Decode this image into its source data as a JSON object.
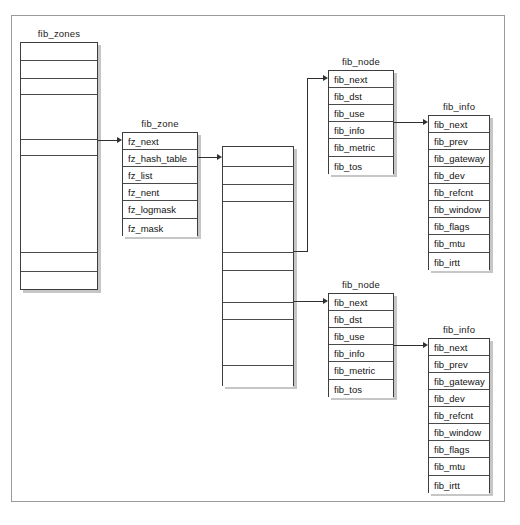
{
  "diagram": {
    "frame": {
      "label": "diagram-frame"
    },
    "structs": [
      {
        "id": "fib-zones",
        "name": "fib_zones",
        "rows": [
          "",
          "",
          "",
          "",
          "",
          "",
          "",
          ""
        ]
      },
      {
        "id": "fib-zone",
        "name": "fib_zone",
        "rows": [
          "fz_next",
          "fz_hash_table",
          "fz_list",
          "fz_nent",
          "fz_logmask",
          "fz_mask"
        ]
      },
      {
        "id": "hash-table",
        "name": "",
        "rows": [
          "",
          "",
          "",
          "",
          "",
          "",
          "",
          "",
          ""
        ]
      },
      {
        "id": "fib-node-top",
        "name": "fib_node",
        "rows": [
          "fib_next",
          "fib_dst",
          "fib_use",
          "fib_info",
          "fib_metric",
          "fib_tos"
        ]
      },
      {
        "id": "fib-info-top",
        "name": "fib_info",
        "rows": [
          "fib_next",
          "fib_prev",
          "fib_gateway",
          "fib_dev",
          "fib_refcnt",
          "fib_window",
          "fib_flags",
          "fib_mtu",
          "fib_irtt"
        ]
      },
      {
        "id": "fib-node-bottom",
        "name": "fib_node",
        "rows": [
          "fib_next",
          "fib_dst",
          "fib_use",
          "fib_info",
          "fib_metric",
          "fib_tos"
        ]
      },
      {
        "id": "fib-info-bottom",
        "name": "fib_info",
        "rows": [
          "fib_next",
          "fib_prev",
          "fib_gateway",
          "fib_dev",
          "fib_refcnt",
          "fib_window",
          "fib_flags",
          "fib_mtu",
          "fib_irtt"
        ]
      }
    ],
    "colors": {
      "line": "#303030",
      "border": "#3d3d3d",
      "shadow": "#c6c6c6",
      "frame": "#9a9a9a",
      "text": "#141414",
      "background": "#ffffff"
    }
  }
}
